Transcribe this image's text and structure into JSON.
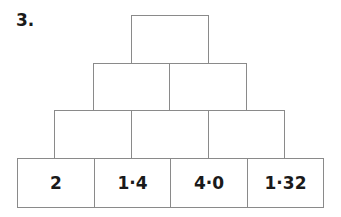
{
  "question": {
    "number": "3."
  },
  "pyramid": {
    "rows": [
      {
        "level": 1,
        "cells": [
          ""
        ]
      },
      {
        "level": 2,
        "cells": [
          "",
          ""
        ]
      },
      {
        "level": 3,
        "cells": [
          "",
          "",
          ""
        ]
      },
      {
        "level": 4,
        "cells": [
          "2",
          "1·4",
          "4·0",
          "1·32"
        ]
      }
    ]
  }
}
